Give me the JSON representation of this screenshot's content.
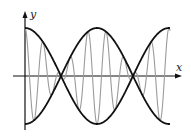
{
  "figure": {
    "x_axis_label": "x",
    "y_axis_label": "y"
  },
  "colors": {
    "envelope": "#111111",
    "carrier": "#9a9a9a",
    "axes": "#111111"
  },
  "chart_data": {
    "type": "line",
    "title": "",
    "xlabel": "x",
    "ylabel": "y",
    "grid": false,
    "legend": null,
    "series": [
      {
        "name": "upper envelope",
        "formula": "A*cos(2*pi*t/T_env)",
        "style": "thick black"
      },
      {
        "name": "lower envelope",
        "formula": "-A*cos(2*pi*t/T_env)",
        "style": "thick black"
      },
      {
        "name": "modulated wave",
        "formula": "A*cos(2*pi*t/T_env)*cos(2*pi*t/T_fast)",
        "style": "thin gray"
      }
    ],
    "params": {
      "A": 1,
      "T_env": 1,
      "T_fast": 0.125,
      "t_range": [
        0,
        1.007
      ]
    },
    "envelope_zero_crossings_t": [
      0.25,
      0.75
    ]
  }
}
